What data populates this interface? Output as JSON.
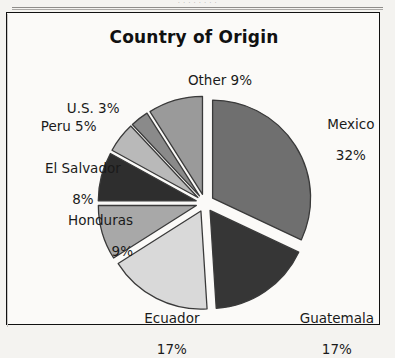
{
  "page": {
    "top_fragment": "·  ·   ·  ·     ·   ·    ·  ·",
    "background_color": "#f4f3f0",
    "frame_border_color": "#111111"
  },
  "chart_data": {
    "type": "pie",
    "title": "Country of Origin",
    "xlabel": "",
    "ylabel": "",
    "exploded": true,
    "legend_position": "none",
    "grid": false,
    "categories": [
      "Mexico",
      "Guatemala",
      "Ecuador",
      "Honduras",
      "El Salvador",
      "Peru",
      "U.S.",
      "Other"
    ],
    "values": [
      32,
      17,
      17,
      9,
      8,
      5,
      3,
      9
    ],
    "unit": "%",
    "slice_colors": [
      "#6f6f6f",
      "#363636",
      "#d9d9d9",
      "#a8a8a8",
      "#2e2e2e",
      "#b9b9b9",
      "#8a8a8a",
      "#9a9a9a"
    ],
    "slice_outline_color": "#3a3a3a",
    "labels": [
      {
        "name": "Mexico",
        "value": 32,
        "text_line1": "Mexico",
        "text_line2": "32%"
      },
      {
        "name": "Guatemala",
        "value": 17,
        "text_line1": "Guatemala",
        "text_line2": "17%"
      },
      {
        "name": "Ecuador",
        "value": 17,
        "text_line1": "Ecuador",
        "text_line2": "17%"
      },
      {
        "name": "Honduras",
        "value": 9,
        "text_line1": "Honduras",
        "text_line2": "9%"
      },
      {
        "name": "El Salvador",
        "value": 8,
        "text_line1": "El Salvador",
        "text_line2": "8%"
      },
      {
        "name": "Peru",
        "value": 5,
        "text_line1": "Peru 5%",
        "text_line2": ""
      },
      {
        "name": "U.S.",
        "value": 3,
        "text_line1": "U.S. 3%",
        "text_line2": ""
      },
      {
        "name": "Other",
        "value": 9,
        "text_line1": "Other 9%",
        "text_line2": ""
      }
    ]
  }
}
